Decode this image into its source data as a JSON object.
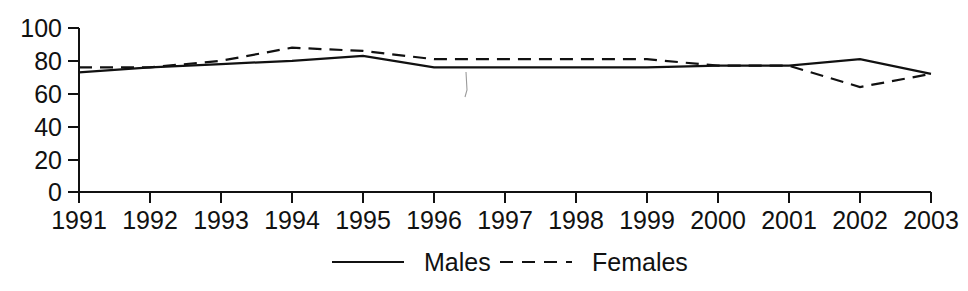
{
  "chart_data": {
    "type": "line",
    "title": "",
    "subtitle": "",
    "xlabel": "",
    "ylabel": "",
    "categories": [
      "1991",
      "1992",
      "1993",
      "1994",
      "1995",
      "1996",
      "1997",
      "1998",
      "1999",
      "2000",
      "2001",
      "2002",
      "2003"
    ],
    "x_tick_labels": [
      "1991",
      "1992",
      "1993",
      "1994",
      "1995",
      "1996",
      "1997",
      "1998",
      "1999",
      "2000",
      "2001",
      "2002",
      "2003"
    ],
    "y_tick_labels": [
      "0",
      "20",
      "40",
      "60",
      "80",
      "100"
    ],
    "y_ticks": [
      0,
      20,
      40,
      60,
      80,
      100
    ],
    "ylim": [
      0,
      100
    ],
    "xlim": [
      "1991",
      "2003"
    ],
    "grid": false,
    "legend_position": "bottom-center",
    "series": [
      {
        "name": "Males",
        "style": "solid",
        "color": "#111111",
        "values": [
          73,
          76,
          78,
          80,
          83,
          76,
          76,
          76,
          76,
          77,
          77,
          81,
          72
        ]
      },
      {
        "name": "Females",
        "style": "dashed",
        "color": "#111111",
        "values": [
          76,
          76,
          80,
          88,
          86,
          81,
          81,
          81,
          81,
          77,
          77,
          64,
          72
        ]
      }
    ],
    "legend": [
      {
        "label": "Males",
        "style": "solid"
      },
      {
        "label": "Females",
        "style": "dashed"
      }
    ]
  },
  "axis": {
    "y_axis_name": "y-axis",
    "x_axis_name": "x-axis"
  }
}
